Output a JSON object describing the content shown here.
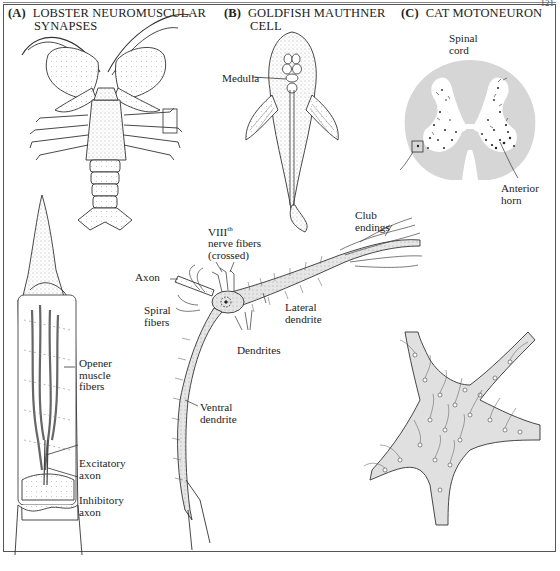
{
  "page": {
    "page_number": "121"
  },
  "panels": [
    {
      "id": "A",
      "letter": "(A)",
      "title_line1": "LOBSTER NEUROMUSCULAR",
      "title_line2": "SYNAPSES",
      "labels": {
        "opener_1": "Opener",
        "opener_2": "muscle",
        "opener_3": "fibers",
        "excitatory_1": "Excitatory",
        "excitatory_2": "axon",
        "inhibitory_1": "Inhibitory",
        "inhibitory_2": "axon"
      }
    },
    {
      "id": "B",
      "letter": "(B)",
      "title_line1": "GOLDFISH MAUTHNER",
      "title_line2": "CELL",
      "labels": {
        "medulla": "Medulla",
        "viii_base": "VIII",
        "viii_sup": "th",
        "viii_2": "nerve fibers",
        "viii_3": "(crossed)",
        "club_1": "Club",
        "club_2": "endings",
        "axon": "Axon",
        "spiral_1": "Spiral",
        "spiral_2": "fibers",
        "lateral_1": "Lateral",
        "lateral_2": "dendrite",
        "dendrites": "Dendrites",
        "ventral_1": "Ventral",
        "ventral_2": "dendrite"
      }
    },
    {
      "id": "C",
      "letter": "(C)",
      "title_line1": "CAT MOTONEURON",
      "labels": {
        "spinal_1": "Spinal",
        "spinal_2": "cord",
        "anterior_1": "Anterior",
        "anterior_2": "horn"
      }
    }
  ],
  "colors": {
    "ink": "#222222",
    "gray_matter_bg": "#d9d9d9",
    "cell_fill": "#e2e2e2",
    "frame": "#555555"
  }
}
